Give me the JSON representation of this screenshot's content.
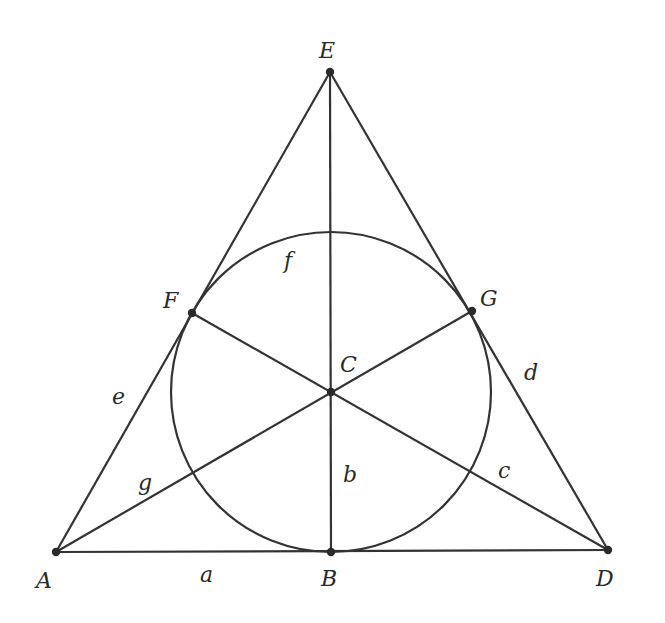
{
  "colors": {
    "line": "#333333",
    "point": "#2a2a2a",
    "background": "#ffffff"
  },
  "points": [
    {
      "id": "A",
      "label": "A",
      "x": 56,
      "y": 552,
      "lx": 36,
      "ly": 588
    },
    {
      "id": "B",
      "label": "B",
      "x": 331,
      "y": 552,
      "lx": 321,
      "ly": 586
    },
    {
      "id": "C",
      "label": "C",
      "x": 331,
      "y": 392,
      "lx": 340,
      "ly": 372
    },
    {
      "id": "D",
      "label": "D",
      "x": 608,
      "y": 550,
      "lx": 596,
      "ly": 586
    },
    {
      "id": "E",
      "label": "E",
      "x": 330,
      "y": 72,
      "lx": 319,
      "ly": 58
    },
    {
      "id": "F",
      "label": "F",
      "x": 192,
      "y": 313,
      "lx": 163,
      "ly": 308
    },
    {
      "id": "G",
      "label": "G",
      "x": 472,
      "y": 311,
      "lx": 480,
      "ly": 306
    }
  ],
  "lines": [
    {
      "id": "a",
      "label": "a",
      "from": "A",
      "to": "D",
      "lx": 200,
      "ly": 582
    },
    {
      "id": "b",
      "label": "b",
      "from": "E",
      "to": "B",
      "lx": 343,
      "ly": 482
    },
    {
      "id": "c",
      "label": "c",
      "from": "F",
      "to": "D",
      "lx": 498,
      "ly": 478
    },
    {
      "id": "d",
      "label": "d",
      "from": "E",
      "to": "D",
      "lx": 524,
      "ly": 380
    },
    {
      "id": "e",
      "label": "e",
      "from": "E",
      "to": "A",
      "lx": 112,
      "ly": 404
    },
    {
      "id": "g",
      "label": "g",
      "from": "A",
      "to": "G",
      "lx": 138,
      "ly": 490
    }
  ],
  "circle": {
    "id": "f",
    "label": "f",
    "cx": 331,
    "cy": 392,
    "r": 160,
    "lx": 284,
    "ly": 268
  }
}
